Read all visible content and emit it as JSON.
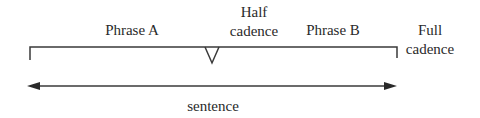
{
  "diagram": {
    "phrase_a": "Phrase A",
    "half_cadence": {
      "line1": "Half",
      "line2": "cadence"
    },
    "phrase_b": "Phrase B",
    "full_cadence": {
      "line1": "Full",
      "line2": "cadence"
    },
    "sentence": "sentence"
  },
  "colors": {
    "stroke": "#3a3a3a",
    "text": "#2a2a2a"
  }
}
